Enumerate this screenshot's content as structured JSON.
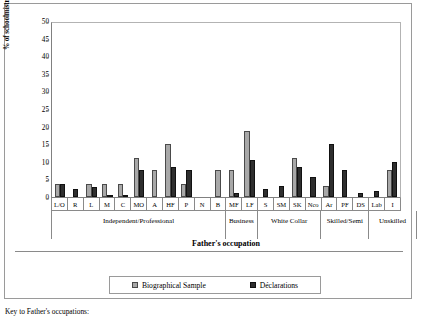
{
  "axis": {
    "ylabel": "% of schoolmistresses",
    "xtitle": "Father's occupation",
    "yticks": [
      "0",
      "5",
      "10",
      "15",
      "20",
      "25",
      "30",
      "35",
      "40",
      "45",
      "50"
    ]
  },
  "legend": {
    "series_1": "Biographical Sample",
    "series_2": "Déclarations",
    "color_1": "#a8a8a8",
    "color_2": "#2e2e2e"
  },
  "caption": "Key to Father's occupations:",
  "groups": [
    {
      "label": "Independent/Professional",
      "span": 11
    },
    {
      "label": "Business",
      "span": 2
    },
    {
      "label": "White Collar",
      "span": 4
    },
    {
      "label": "Skilled/\nSemi",
      "span": 3
    },
    {
      "label": "Unskilled",
      "span": 3
    }
  ],
  "chart_data": {
    "type": "bar",
    "title": "",
    "xlabel": "Father's occupation",
    "ylabel": "% of schoolmistresses",
    "ylim": [
      0,
      50
    ],
    "ytick_step": 5,
    "grid": false,
    "legend_position": "bottom",
    "categories": [
      "L/O",
      "R",
      "L",
      "M",
      "C",
      "MO",
      "A",
      "HF",
      "P",
      "N",
      "B",
      "MF",
      "LF",
      "S",
      "SM",
      "SK",
      "Nco",
      "Ar",
      "PF",
      "DS",
      "Lab",
      "I"
    ],
    "series": [
      {
        "name": "Biographical Sample",
        "color": "#a8a8a8",
        "values": [
          3.7,
          0,
          3.7,
          3.7,
          3.7,
          11.2,
          7.7,
          15.0,
          3.7,
          0,
          7.7,
          7.7,
          18.8,
          0,
          0,
          11.2,
          0,
          3.1,
          0,
          0,
          0,
          7.7
        ]
      },
      {
        "name": "Déclarations",
        "color": "#2e2e2e",
        "values": [
          3.7,
          2.3,
          2.9,
          0.3,
          0.3,
          7.7,
          0,
          8.5,
          7.7,
          0,
          0,
          1.2,
          10.4,
          2.3,
          3.1,
          8.5,
          5.8,
          15.0,
          7.7,
          1.2,
          1.6,
          10.0
        ]
      }
    ]
  }
}
